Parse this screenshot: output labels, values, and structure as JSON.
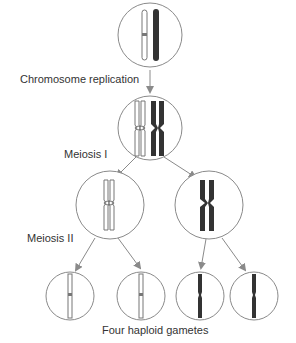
{
  "diagram": {
    "labels": {
      "replication": "Chromosome replication",
      "meiosis1": "Meiosis I",
      "meiosis2": "Meiosis II",
      "gametes": "Four haploid gametes"
    },
    "colors": {
      "circle_stroke": "#8a8a8a",
      "arrow": "#8a8a8a",
      "light_chromosome_fill": "#ffffff",
      "light_chromosome_stroke": "#777777",
      "dark_chromosome_fill": "#333333"
    },
    "stages": [
      {
        "name": "parent-cell",
        "cx": 150,
        "cy": 35,
        "r": 32
      },
      {
        "name": "replicated-cell",
        "cx": 150,
        "cy": 128,
        "r": 32
      },
      {
        "name": "meiosis1-left",
        "cx": 150,
        "cy": 128,
        "r": 32
      },
      {
        "name": "daughter-left",
        "cx": 105,
        "cy": 205,
        "r": 34
      },
      {
        "name": "daughter-right",
        "cx": 209,
        "cy": 205,
        "r": 34
      },
      {
        "name": "gamete-1",
        "cx": 67,
        "cy": 296,
        "r": 25
      },
      {
        "name": "gamete-2",
        "cx": 142,
        "cy": 296,
        "r": 25
      },
      {
        "name": "gamete-3",
        "cx": 198,
        "cy": 296,
        "r": 25
      },
      {
        "name": "gamete-4",
        "cx": 252,
        "cy": 296,
        "r": 25
      }
    ]
  }
}
